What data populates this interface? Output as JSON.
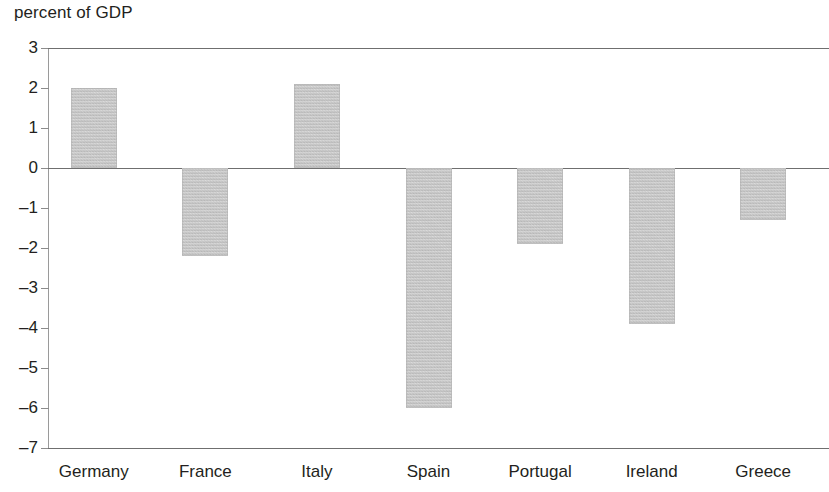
{
  "chart_data": {
    "type": "bar",
    "title": "percent of GDP",
    "xlabel": "",
    "ylabel": "",
    "categories": [
      "Germany",
      "France",
      "Italy",
      "Spain",
      "Portugal",
      "Ireland",
      "Greece"
    ],
    "values": [
      2.0,
      -2.2,
      2.1,
      -6.0,
      -1.9,
      -3.9,
      -1.3
    ],
    "ylim": [
      -7,
      3
    ],
    "yticks": [
      3,
      2,
      1,
      0,
      -1,
      -2,
      -3,
      -4,
      -5,
      -6,
      -7
    ],
    "ytick_labels": [
      "3",
      "2",
      "1",
      "0",
      "–1",
      "–2",
      "–3",
      "–4",
      "–5",
      "–6",
      "–7"
    ],
    "grid": false,
    "gridlines_shown": [
      3,
      0,
      -7
    ],
    "legend": null,
    "bar_color": "#c2c2c2",
    "axis_color": "#6f6f6f",
    "text_color": "#231f20"
  }
}
